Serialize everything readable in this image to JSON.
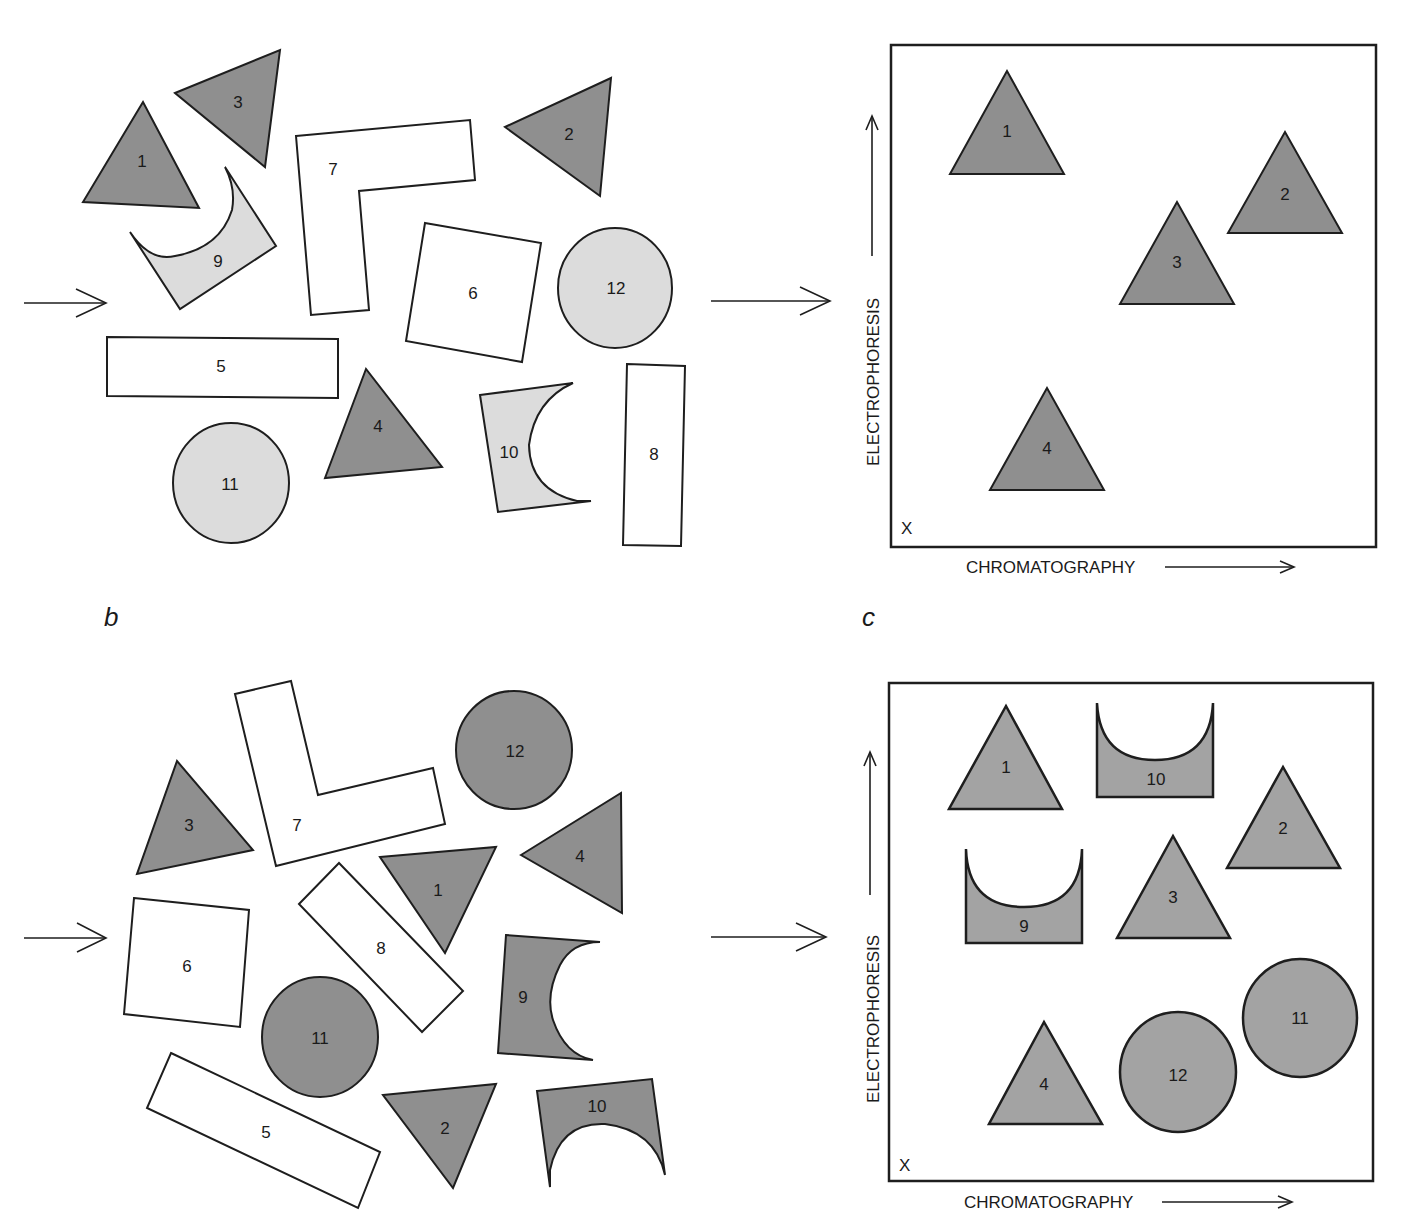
{
  "panel_labels": {
    "b": "b",
    "c": "c"
  },
  "panel_a_mixture": {
    "shapes": [
      {
        "id": "1",
        "type": "triangle",
        "shade": "dark"
      },
      {
        "id": "2",
        "type": "triangle",
        "shade": "dark"
      },
      {
        "id": "3",
        "type": "triangle",
        "shade": "dark"
      },
      {
        "id": "4",
        "type": "triangle",
        "shade": "dark"
      },
      {
        "id": "5",
        "type": "rectangle",
        "shade": "white"
      },
      {
        "id": "6",
        "type": "square",
        "shade": "white"
      },
      {
        "id": "7",
        "type": "l-shape",
        "shade": "white"
      },
      {
        "id": "8",
        "type": "rectangle",
        "shade": "white"
      },
      {
        "id": "9",
        "type": "crescent-block",
        "shade": "light"
      },
      {
        "id": "10",
        "type": "crescent-block",
        "shade": "light"
      },
      {
        "id": "11",
        "type": "circle",
        "shade": "light"
      },
      {
        "id": "12",
        "type": "circle",
        "shade": "light"
      }
    ]
  },
  "panel_a_map": {
    "x_axis": "CHROMATOGRAPHY",
    "y_axis": "ELECTROPHORESIS",
    "origin_marker": "X",
    "spots": [
      "1",
      "2",
      "3",
      "4"
    ]
  },
  "panel_b_mixture": {
    "shapes": [
      {
        "id": "1",
        "type": "triangle",
        "shade": "dark"
      },
      {
        "id": "2",
        "type": "triangle",
        "shade": "dark"
      },
      {
        "id": "3",
        "type": "triangle",
        "shade": "dark"
      },
      {
        "id": "4",
        "type": "triangle",
        "shade": "dark"
      },
      {
        "id": "5",
        "type": "rectangle",
        "shade": "white"
      },
      {
        "id": "6",
        "type": "square",
        "shade": "white"
      },
      {
        "id": "7",
        "type": "l-shape",
        "shade": "white"
      },
      {
        "id": "8",
        "type": "rectangle",
        "shade": "white"
      },
      {
        "id": "9",
        "type": "crescent-block",
        "shade": "dark"
      },
      {
        "id": "10",
        "type": "crescent-block",
        "shade": "dark"
      },
      {
        "id": "11",
        "type": "circle",
        "shade": "dark"
      },
      {
        "id": "12",
        "type": "circle",
        "shade": "dark"
      }
    ]
  },
  "panel_c_map": {
    "x_axis": "CHROMATOGRAPHY",
    "y_axis": "ELECTROPHORESIS",
    "origin_marker": "X",
    "spots": [
      "1",
      "10",
      "2",
      "9",
      "3",
      "4",
      "12",
      "11"
    ]
  },
  "colors": {
    "dark_fill": "#8f8f8f",
    "light_fill": "#dcdcdc",
    "map_fill": "#a3a3a3",
    "outline": "#1e1e1e"
  }
}
